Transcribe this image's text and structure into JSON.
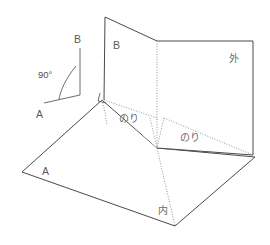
{
  "figure": {
    "title_visible": false,
    "background_color": "#ffffff",
    "line_color": "#4a4a4a",
    "fold_line_color": "#8a8a8a",
    "label_color": "#5a5a5a"
  },
  "angle_inset": {
    "angle_label": "90°",
    "top_label": "B",
    "bottom_label": "A"
  },
  "panels": {
    "vertical_left_label": "B",
    "vertical_right_label": "外",
    "base_left_label": "A",
    "base_bottom_label": "内"
  },
  "glue_tabs": [
    {
      "label": "のり"
    },
    {
      "label": "のり"
    }
  ],
  "icons": {
    "fold_arrow": "fold-arrow-icon"
  }
}
